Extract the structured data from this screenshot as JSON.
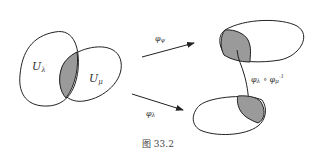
{
  "figure": {
    "caption": "图 33.2",
    "sets": {
      "u_lambda": "U",
      "u_lambda_sub": "λ",
      "u_mu": "U",
      "u_mu_sub": "μ"
    },
    "arrows": {
      "top": {
        "label": "φ",
        "sub": "ψ"
      },
      "bottom": {
        "label": "φ",
        "sub": "λ"
      },
      "transition": {
        "label": "φ",
        "sub": "λ",
        "op": " ∘ ",
        "label2": "φ",
        "sub2": "μ",
        "sup2": "-1"
      }
    },
    "colors": {
      "stroke": "#222222",
      "fill_overlap": "#9a9a9a",
      "background": "#ffffff"
    }
  }
}
